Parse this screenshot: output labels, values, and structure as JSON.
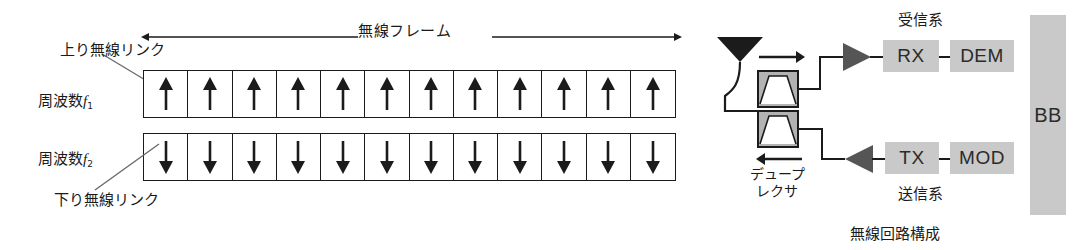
{
  "figure": {
    "left_panel": {
      "frame_arrow_label": "無線フレーム",
      "uplink_label": "上り無線リンク",
      "downlink_label": "下り無線リンク",
      "freq1_label": {
        "text": "周波数",
        "symbol": "f",
        "subscript": "1"
      },
      "freq2_label": {
        "text": "周波数",
        "symbol": "f",
        "subscript": "2"
      },
      "row_uplink": {
        "name": "uplink-slot-row",
        "slot_count": 12,
        "arrow_direction": "up",
        "slots": [
          "↑",
          "↑",
          "↑",
          "↑",
          "↑",
          "↑",
          "↑",
          "↑",
          "↑",
          "↑",
          "↑",
          "↑"
        ]
      },
      "row_downlink": {
        "name": "downlink-slot-row",
        "slot_count": 12,
        "arrow_direction": "down",
        "slots": [
          "↓",
          "↓",
          "↓",
          "↓",
          "↓",
          "↓",
          "↓",
          "↓",
          "↓",
          "↓",
          "↓",
          "↓"
        ]
      }
    },
    "right_panel": {
      "caption": "無線回路構成",
      "rx_section_label": "受信系",
      "tx_section_label": "送信系",
      "duplexer_label_line1": "デュープ",
      "duplexer_label_line2": "レクサ",
      "blocks": {
        "rx": "RX",
        "dem": "DEM",
        "tx": "TX",
        "mod": "MOD",
        "bb": "BB"
      },
      "flow_arrows": {
        "receive": "→",
        "transmit": "←"
      }
    }
  },
  "colors": {
    "ink": "#1b1b1b",
    "block_gray": "#c9c9c9",
    "amp_gray": "#555555",
    "filter_gray": "#b3b3b3",
    "page_bg": "#ffffff"
  }
}
